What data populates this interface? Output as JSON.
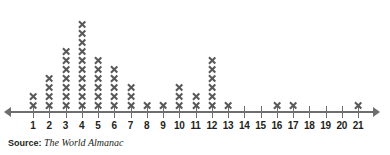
{
  "chart_data": {
    "type": "scatter",
    "plot_style": "dot-plot",
    "title": "",
    "xlabel": "",
    "ylabel": "",
    "xlim": [
      0.3,
      21.7
    ],
    "grid": false,
    "legend": null,
    "marker": "x",
    "marker_color": "#58595b",
    "axis_color": "#6d6e70",
    "categories": [
      1,
      2,
      3,
      4,
      5,
      6,
      7,
      8,
      9,
      10,
      11,
      12,
      13,
      14,
      15,
      16,
      17,
      18,
      19,
      20,
      21
    ],
    "values": [
      2,
      4,
      7,
      10,
      6,
      5,
      3,
      1,
      1,
      3,
      2,
      6,
      1,
      0,
      0,
      1,
      1,
      0,
      0,
      0,
      1
    ],
    "tick_labels": [
      "1",
      "2",
      "3",
      "4",
      "5",
      "6",
      "7",
      "8",
      "9",
      "10",
      "11",
      "12",
      "13",
      "14",
      "15",
      "16",
      "17",
      "18",
      "19",
      "20",
      "21"
    ],
    "total_count": 54,
    "annotations": []
  },
  "source": {
    "label": "Source:",
    "text": "The World Almanac"
  }
}
